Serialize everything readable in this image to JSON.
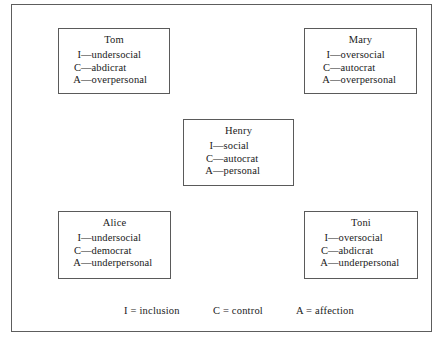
{
  "figure": {
    "name": "firo-b-interpersonal-needs-diagram",
    "frame_color": "#5d5d5d",
    "box_border_color": "#5a5a5a",
    "background_color": "#ffffff",
    "text_color": "#1a1a1a"
  },
  "people": [
    {
      "id": "tom",
      "name": "Tom",
      "traits": [
        {
          "code": "I",
          "dash": "—",
          "value": "undersocial"
        },
        {
          "code": "C",
          "dash": "—",
          "value": "abdicrat"
        },
        {
          "code": "A",
          "dash": "—",
          "value": "overpersonal"
        }
      ]
    },
    {
      "id": "mary",
      "name": "Mary",
      "traits": [
        {
          "code": "I",
          "dash": "—",
          "value": "oversocial"
        },
        {
          "code": "C",
          "dash": "—",
          "value": "autocrat"
        },
        {
          "code": "A",
          "dash": "—",
          "value": "overpersonal"
        }
      ]
    },
    {
      "id": "henry",
      "name": "Henry",
      "traits": [
        {
          "code": "I",
          "dash": "—",
          "value": "social"
        },
        {
          "code": "C",
          "dash": "—",
          "value": "autocrat"
        },
        {
          "code": "A",
          "dash": "—",
          "value": "personal"
        }
      ]
    },
    {
      "id": "alice",
      "name": "Alice",
      "traits": [
        {
          "code": "I",
          "dash": "—",
          "value": "undersocial"
        },
        {
          "code": "C",
          "dash": "—",
          "value": "democrat"
        },
        {
          "code": "A",
          "dash": "—",
          "value": "underpersonal"
        }
      ]
    },
    {
      "id": "toni",
      "name": "Toni",
      "traits": [
        {
          "code": "I",
          "dash": "—",
          "value": "oversocial"
        },
        {
          "code": "C",
          "dash": "—",
          "value": "abdicrat"
        },
        {
          "code": "A",
          "dash": "—",
          "value": "underpersonal"
        }
      ]
    }
  ],
  "legend": {
    "inclusion": "I = inclusion",
    "control": "C = control",
    "affection": "A = affection"
  }
}
